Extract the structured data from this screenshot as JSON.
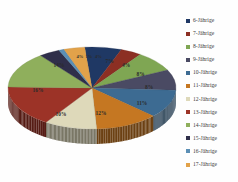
{
  "chart_data": {
    "type": "pie",
    "title": "",
    "subtitle": "",
    "xlabel": "",
    "ylabel": "",
    "legend_position": "right",
    "grid": false,
    "three_d": true,
    "categories": [
      "6-Jährige",
      "7-Jährige",
      "8-Jährige",
      "9-Jährige",
      "10-Jährige",
      "11-Jährige",
      "12-Jährige",
      "13-Jährige",
      "14-Jährige",
      "15-Jährige",
      "16-Jährige",
      "17-Jährige"
    ],
    "values": [
      7,
      4,
      8,
      8,
      11,
      12,
      10,
      16,
      14,
      4,
      1,
      4
    ],
    "value_labels": [
      "7%",
      "4%",
      "8%",
      "8%",
      "11%",
      "12%",
      "10%",
      "16%",
      "14%",
      "4%",
      "1%",
      "4%"
    ],
    "colors": [
      "#1f3864",
      "#8c2f23",
      "#7fa653",
      "#4a4a63",
      "#3d6b92",
      "#c57722",
      "#ded9ba",
      "#9c3327",
      "#8faf5c",
      "#2f2f4a",
      "#5b8fb5",
      "#e2a24a"
    ]
  },
  "legend": {
    "items": [
      {
        "label": "6-Jährige",
        "color": "#1f3864"
      },
      {
        "label": "7-Jährige",
        "color": "#8c2f23"
      },
      {
        "label": "8-Jährige",
        "color": "#7fa653"
      },
      {
        "label": "9-Jährige",
        "color": "#4a4a63"
      },
      {
        "label": "10-Jährige",
        "color": "#3d6b92"
      },
      {
        "label": "11-Jährige",
        "color": "#c57722"
      },
      {
        "label": "12-Jährige",
        "color": "#ded9ba"
      },
      {
        "label": "13-Jährige",
        "color": "#9c3327"
      },
      {
        "label": "14-Jährige",
        "color": "#8faf5c"
      },
      {
        "label": "15-Jährige",
        "color": "#2f2f4a"
      },
      {
        "label": "16-Jährige",
        "color": "#5b8fb5"
      },
      {
        "label": "17-Jährige",
        "color": "#e2a24a"
      }
    ]
  },
  "slice_labels": [
    {
      "text": "7%",
      "x": 103.5,
      "y": 25.0
    },
    {
      "text": "4%",
      "x": 120.0,
      "y": 28.5
    },
    {
      "text": "8%",
      "x": 134.5,
      "y": 38.0
    },
    {
      "text": "8%",
      "x": 143.0,
      "y": 50.5
    },
    {
      "text": "11%",
      "x": 136.0,
      "y": 66.5
    },
    {
      "text": "12%",
      "x": 95.0,
      "y": 77.0
    },
    {
      "text": "10%",
      "x": 55.0,
      "y": 77.5
    },
    {
      "text": "16%",
      "x": 32.0,
      "y": 53.5
    },
    {
      "text": "14%",
      "x": 53.0,
      "y": 29.0
    },
    {
      "text": "4%",
      "x": 74.0,
      "y": 20.0
    },
    {
      "text": "1%",
      "x": 83.0,
      "y": 19.5
    },
    {
      "text": "4%",
      "x": 92.5,
      "y": 19.5
    }
  ]
}
